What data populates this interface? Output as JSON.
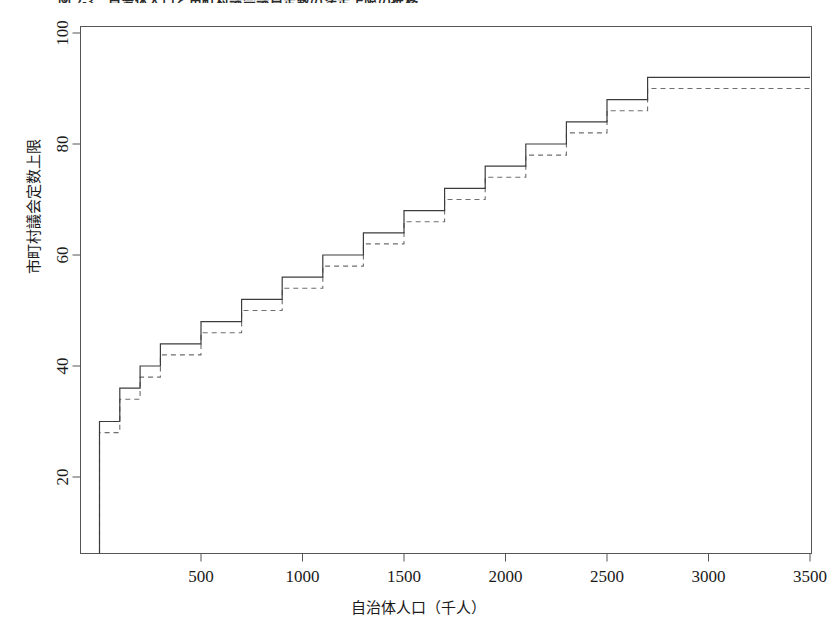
{
  "figure": {
    "caption": "図 2-3　自治体人口と市町村議会議員定数の法定上限の推移",
    "caption_clipped": true
  },
  "chart_data": {
    "type": "line",
    "subtype": "step",
    "title": "",
    "xlabel": "自治体人口（千人）",
    "ylabel": "市町村議会定数上限",
    "xlim": [
      0,
      3500
    ],
    "ylim": [
      10,
      102
    ],
    "xticks": [
      500,
      1000,
      1500,
      2000,
      2500,
      3000,
      3500
    ],
    "xtick_labels": [
      "500",
      "1000",
      "1500",
      "2000",
      "2500",
      "3000",
      "3500"
    ],
    "yticks": [
      20,
      40,
      60,
      80,
      100
    ],
    "ytick_labels": [
      "20",
      "40",
      "60",
      "80",
      "100"
    ],
    "grid": false,
    "legend": "none",
    "series": [
      {
        "name": "solid-step",
        "style": "solid",
        "color": "#3c3c3c",
        "x": [
          0,
          5,
          10,
          20,
          30,
          40,
          50,
          70,
          100,
          130,
          200,
          300,
          500,
          700,
          900,
          1100,
          1300,
          1500,
          1700,
          1900,
          2100,
          2300,
          2500,
          2700,
          3500
        ],
        "y": [
          12,
          16,
          18,
          22,
          26,
          30,
          30,
          34,
          34,
          38,
          40,
          44,
          46,
          50,
          54,
          58,
          60,
          64,
          68,
          72,
          76,
          80,
          84,
          88,
          92
        ]
      },
      {
        "name": "dashed-step",
        "style": "dashed",
        "color": "#6e6e6e",
        "x": [
          0,
          5,
          10,
          20,
          30,
          40,
          50,
          70,
          100,
          130,
          200,
          300,
          500,
          700,
          900,
          1100,
          1300,
          1500,
          1700,
          1900,
          2100,
          2300,
          2500,
          2700,
          3500
        ],
        "y": [
          12,
          15,
          17,
          21,
          25,
          28,
          28,
          32,
          32,
          36,
          38,
          42,
          44,
          48,
          52,
          56,
          58,
          62,
          66,
          70,
          74,
          78,
          82,
          86,
          90
        ]
      }
    ],
    "solid_levels": [
      {
        "x_start": 0,
        "x_end": 50,
        "value": 30
      },
      {
        "x_start": 50,
        "x_end": 100,
        "value": 30
      },
      {
        "x_start": 100,
        "x_end": 200,
        "value": 36
      },
      {
        "x_start": 200,
        "x_end": 300,
        "value": 40
      },
      {
        "x_start": 300,
        "x_end": 500,
        "value": 44
      },
      {
        "x_start": 500,
        "x_end": 700,
        "value": 48
      },
      {
        "x_start": 700,
        "x_end": 900,
        "value": 52
      },
      {
        "x_start": 900,
        "x_end": 1100,
        "value": 56
      },
      {
        "x_start": 1100,
        "x_end": 1300,
        "value": 60
      },
      {
        "x_start": 1300,
        "x_end": 1500,
        "value": 64
      },
      {
        "x_start": 1500,
        "x_end": 1700,
        "value": 68
      },
      {
        "x_start": 1700,
        "x_end": 1900,
        "value": 72
      },
      {
        "x_start": 1900,
        "x_end": 2100,
        "value": 76
      },
      {
        "x_start": 2100,
        "x_end": 2300,
        "value": 80
      },
      {
        "x_start": 2300,
        "x_end": 2500,
        "value": 84
      },
      {
        "x_start": 2500,
        "x_end": 2700,
        "value": 88
      },
      {
        "x_start": 2700,
        "x_end": 3500,
        "value": 92
      }
    ],
    "dashed_levels": [
      {
        "x_start": 0,
        "x_end": 50,
        "value": 28
      },
      {
        "x_start": 50,
        "x_end": 100,
        "value": 28
      },
      {
        "x_start": 100,
        "x_end": 200,
        "value": 34
      },
      {
        "x_start": 200,
        "x_end": 300,
        "value": 38
      },
      {
        "x_start": 300,
        "x_end": 500,
        "value": 42
      },
      {
        "x_start": 500,
        "x_end": 700,
        "value": 46
      },
      {
        "x_start": 700,
        "x_end": 900,
        "value": 50
      },
      {
        "x_start": 900,
        "x_end": 1100,
        "value": 54
      },
      {
        "x_start": 1100,
        "x_end": 1300,
        "value": 58
      },
      {
        "x_start": 1300,
        "x_end": 1500,
        "value": 62
      },
      {
        "x_start": 1500,
        "x_end": 1700,
        "value": 66
      },
      {
        "x_start": 1700,
        "x_end": 1900,
        "value": 70
      },
      {
        "x_start": 1900,
        "x_end": 2100,
        "value": 74
      },
      {
        "x_start": 2100,
        "x_end": 2300,
        "value": 78
      },
      {
        "x_start": 2300,
        "x_end": 2500,
        "value": 82
      },
      {
        "x_start": 2500,
        "x_end": 2700,
        "value": 86
      },
      {
        "x_start": 2700,
        "x_end": 3500,
        "value": 90
      }
    ]
  }
}
